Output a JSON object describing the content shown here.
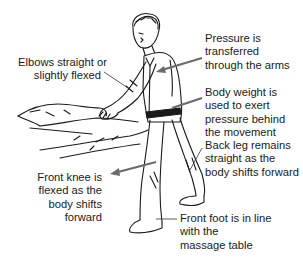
{
  "diagram": {
    "type": "instructional-illustration",
    "colors": {
      "ink": "#1a1a1a",
      "arrow": "#6b6b6b",
      "leader": "#333333",
      "background": "#ffffff"
    },
    "labels": [
      {
        "id": "elbows",
        "lines": [
          "Elbows straight or",
          "slightly flexed"
        ],
        "pointer": "thin-line",
        "target": "elbow"
      },
      {
        "id": "pressure",
        "lines": [
          "Pressure is",
          "transferred",
          "through the arms"
        ],
        "pointer": "arrow",
        "target": "upper-arm"
      },
      {
        "id": "body-weight",
        "lines": [
          "Body weight is",
          "used to exert",
          "pressure behind",
          "the movement"
        ],
        "pointer": "arrow",
        "target": "waist-belt"
      },
      {
        "id": "back-leg",
        "lines": [
          "Back leg remains",
          "straight as the",
          "body shifts forward"
        ],
        "pointer": "thin-line",
        "target": "back-leg"
      },
      {
        "id": "front-knee",
        "lines": [
          "Front knee is",
          "flexed as the",
          "body shifts",
          "forward"
        ],
        "pointer": "arrow",
        "target": "front-knee"
      },
      {
        "id": "front-foot",
        "lines": [
          "Front foot is in line",
          "with the",
          "massage table"
        ],
        "pointer": "thin-line",
        "target": "front-foot"
      }
    ]
  }
}
